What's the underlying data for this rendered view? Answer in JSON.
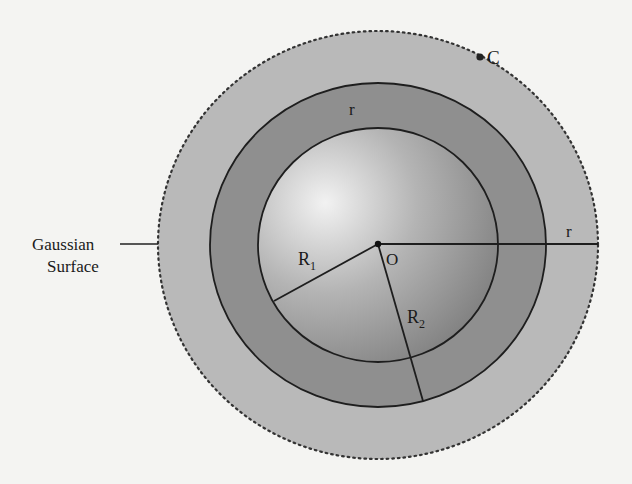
{
  "figure": {
    "labels": {
      "point_c": "C",
      "center": "O",
      "r1": "R",
      "r1_sub": "1",
      "r2": "R",
      "r2_sub": "2",
      "r_shell": "r",
      "r_radius": "r",
      "gaussian_line1": "Gaussian",
      "gaussian_line2": "Surface"
    },
    "colors": {
      "background": "#f4f4f2",
      "gaussian_fill": "#b9b9b9",
      "shell_fill": "#8f8f8f",
      "sphere_highlight": "#f0f0f0",
      "sphere_shadow": "#7e7e7e",
      "stroke": "#1e1e1e"
    },
    "geometry": {
      "center": [
        378,
        244
      ],
      "gaussian_radius": [
        220,
        214
      ],
      "outer_shell_radius": [
        168,
        162
      ],
      "inner_sphere_radius": [
        120,
        117
      ],
      "point_c": [
        480,
        57
      ]
    }
  }
}
